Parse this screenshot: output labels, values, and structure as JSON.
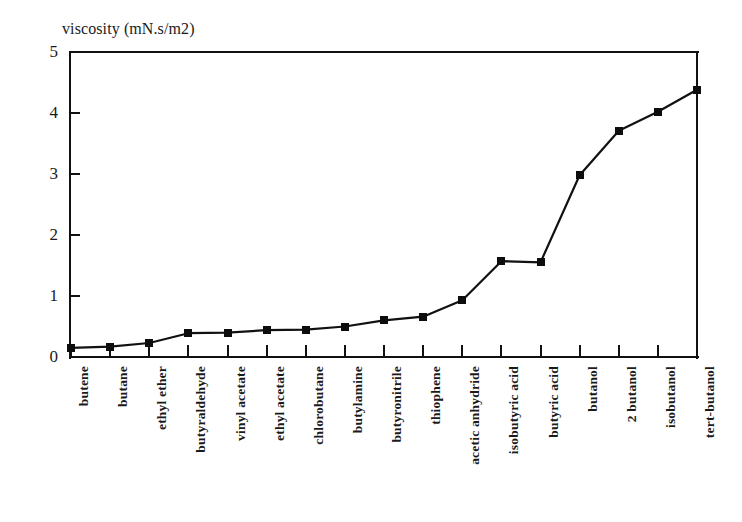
{
  "chart_data": {
    "type": "line",
    "title": "viscosity (mN.s/m2)",
    "xlabel": "",
    "ylabel": "viscosity (mN.s/m2)",
    "ylim": [
      0,
      5
    ],
    "yticks": [
      0,
      1,
      2,
      3,
      4,
      5
    ],
    "ytick_labels": [
      "0",
      "1",
      "2",
      "3",
      "4",
      "5"
    ],
    "grid": false,
    "legend": null,
    "marker": "square",
    "line_color": "#111111",
    "marker_color": "#0d0d0d",
    "categories": [
      "butene",
      "butane",
      "ethyl ether",
      "butyraldehyde",
      "vinyl acetate",
      "ethyl acetate",
      "chlorobutane",
      "butylamine",
      "butyronitrile",
      "thiophene",
      "acetic anhydride",
      "isobutyric acid",
      "butyric acid",
      "butanol",
      "2 butanol",
      "isobutanol",
      "tert-butanol"
    ],
    "values": [
      0.15,
      0.17,
      0.23,
      0.39,
      0.4,
      0.44,
      0.45,
      0.5,
      0.6,
      0.66,
      0.93,
      1.57,
      1.55,
      2.98,
      3.71,
      4.02,
      4.38
    ]
  }
}
